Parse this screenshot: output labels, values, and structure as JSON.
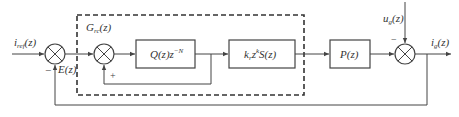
{
  "diagram": {
    "type": "block-diagram",
    "title": "",
    "input": {
      "main": "i",
      "sub": "ref",
      "arg": "(z)"
    },
    "output": {
      "main": "i",
      "sub": "g",
      "arg": "(z)"
    },
    "disturbance": {
      "main": "u",
      "sub": "g",
      "arg": "(z)"
    },
    "error": {
      "label": "E(z)"
    },
    "controller_group": {
      "main": "G",
      "sub": "rc",
      "arg": "(z)"
    },
    "blocks": [
      {
        "id": "Q",
        "label_main": "Q(z)z",
        "label_sup": "−N"
      },
      {
        "id": "K",
        "label_main": "k",
        "label_sub": "r",
        "label_mid": "z",
        "label_sup": "k",
        "label_end": "S(z)"
      },
      {
        "id": "P",
        "label": "P(z)"
      }
    ],
    "signs": {
      "sum1_feedback": "−",
      "sum2_feedback": "+",
      "sum3_disturbance": "−"
    },
    "colors": {
      "line": "#444444",
      "text": "#333333",
      "background": "#ffffff"
    }
  }
}
